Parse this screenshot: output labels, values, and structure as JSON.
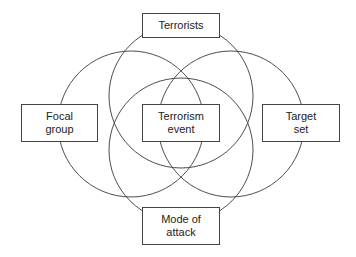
{
  "diagram": {
    "type": "venn-diagram",
    "line_color": "#3a3a3a",
    "circles": [
      {
        "id": "terrorists",
        "cx": 181,
        "cy": 96,
        "r": 72
      },
      {
        "id": "focal-group",
        "cx": 131,
        "cy": 124,
        "r": 73
      },
      {
        "id": "target-set",
        "cx": 231,
        "cy": 124,
        "r": 73
      },
      {
        "id": "mode-of-attack",
        "cx": 181,
        "cy": 150,
        "r": 72
      }
    ],
    "nodes": {
      "terrorists": {
        "line1": "Terrorists",
        "line2": ""
      },
      "focal_group": {
        "line1": "Focal",
        "line2": "group"
      },
      "terrorism_event": {
        "line1": "Terrorism",
        "line2": "event"
      },
      "target_set": {
        "line1": "Target",
        "line2": "set"
      },
      "mode_of_attack": {
        "line1": "Mode of",
        "line2": "attack"
      }
    }
  }
}
